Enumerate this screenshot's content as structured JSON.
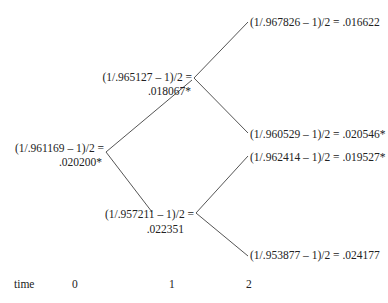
{
  "tree": {
    "root": {
      "formula": "(1/.961169 – 1)/2 =",
      "value": ".020200*"
    },
    "t1_up": {
      "formula": "(1/.965127 – 1)/2 =",
      "value": ".018067*"
    },
    "t1_down": {
      "formula": "(1/.957211 – 1)/2 =",
      "value": ".022351"
    },
    "t2_uu": "(1/.967826 – 1)/2 = .016622",
    "t2_ud": "(1/.960529 – 1)/2 = .020546*",
    "t2_du": "(1/.962414 – 1)/2 = .019527*",
    "t2_dd": "(1/.953877 – 1)/2 = .024177"
  },
  "axis": {
    "label": "time",
    "ticks": [
      "0",
      "1",
      "2"
    ]
  }
}
